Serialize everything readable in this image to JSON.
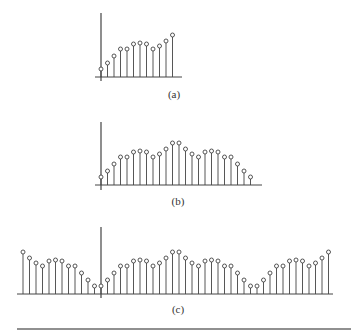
{
  "figure": {
    "panels": [
      {
        "id": "a",
        "caption": "(a)",
        "n_start": 0,
        "values": [
          8,
          14,
          21,
          28,
          28,
          33,
          34,
          33,
          28,
          31,
          36,
          42
        ]
      },
      {
        "id": "b",
        "caption": "(b)",
        "n_start": 0,
        "values": [
          8,
          14,
          21,
          28,
          28,
          33,
          34,
          33,
          28,
          31,
          36,
          42,
          42,
          36,
          31,
          28,
          33,
          34,
          33,
          28,
          28,
          21,
          14,
          8
        ]
      },
      {
        "id": "c",
        "caption": "(c)",
        "n_start": -12,
        "values": [
          42,
          36,
          31,
          28,
          33,
          34,
          33,
          28,
          28,
          21,
          14,
          8,
          8,
          14,
          21,
          28,
          28,
          33,
          34,
          33,
          28,
          31,
          36,
          42,
          42,
          36,
          31,
          28,
          33,
          34,
          33,
          28,
          28,
          21,
          14,
          8,
          8,
          14,
          21,
          28,
          28,
          33,
          34,
          33,
          28,
          31,
          36,
          42
        ]
      }
    ],
    "colors": {
      "stroke": "#444444",
      "rule": "#222222"
    }
  }
}
